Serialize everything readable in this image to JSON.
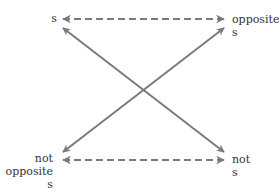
{
  "diagram": {
    "type": "square-of-opposition",
    "colors": {
      "line": "#7a7a7a",
      "text": "#333333",
      "background": "#ffffff"
    },
    "nodes": {
      "top_left": {
        "lines": [
          "s"
        ]
      },
      "top_right": {
        "lines": [
          "opposite",
          "s"
        ]
      },
      "bottom_left": {
        "lines": [
          "not",
          "opposite",
          "s"
        ]
      },
      "bottom_right": {
        "lines": [
          "not",
          "s"
        ]
      }
    },
    "edges": [
      {
        "from": "top_left",
        "to": "top_right",
        "style": "dashed",
        "arrows": "both"
      },
      {
        "from": "bottom_left",
        "to": "bottom_right",
        "style": "dashed",
        "arrows": "both"
      },
      {
        "from": "top_left",
        "to": "bottom_right",
        "style": "solid",
        "arrows": "both"
      },
      {
        "from": "bottom_left",
        "to": "top_right",
        "style": "solid",
        "arrows": "both"
      }
    ]
  }
}
